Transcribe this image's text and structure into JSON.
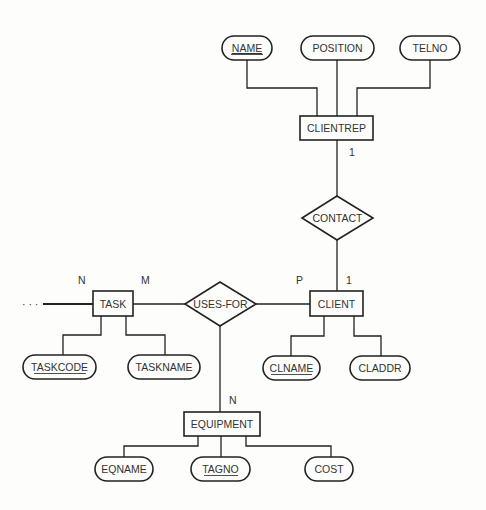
{
  "diagram": {
    "type": "er-diagram",
    "entities": [
      {
        "id": "clientrep",
        "label": "CLIENTREP"
      },
      {
        "id": "client",
        "label": "CLIENT"
      },
      {
        "id": "task",
        "label": "TASK"
      },
      {
        "id": "equipment",
        "label": "EQUIPMENT"
      }
    ],
    "relationships": [
      {
        "id": "contact",
        "label": "CONTACT"
      },
      {
        "id": "usesfor",
        "label": "USES-FOR"
      }
    ],
    "attributes": [
      {
        "id": "name",
        "label": "NAME",
        "key": true,
        "entity": "CLIENTREP"
      },
      {
        "id": "position",
        "label": "POSITION",
        "key": false,
        "entity": "CLIENTREP"
      },
      {
        "id": "telno",
        "label": "TELNO",
        "key": false,
        "entity": "CLIENTREP"
      },
      {
        "id": "taskcode",
        "label": "TASKCODE",
        "key": true,
        "entity": "TASK"
      },
      {
        "id": "taskname",
        "label": "TASKNAME",
        "key": false,
        "entity": "TASK"
      },
      {
        "id": "clname",
        "label": "CLNAME",
        "key": true,
        "entity": "CLIENT"
      },
      {
        "id": "claddr",
        "label": "CLADDR",
        "key": false,
        "entity": "CLIENT"
      },
      {
        "id": "eqname",
        "label": "EQNAME",
        "key": false,
        "entity": "EQUIPMENT"
      },
      {
        "id": "tagno",
        "label": "TAGNO",
        "key": true,
        "entity": "EQUIPMENT"
      },
      {
        "id": "cost",
        "label": "COST",
        "key": false,
        "entity": "EQUIPMENT"
      }
    ],
    "cardinalities": {
      "clientrep_contact": "1",
      "client_contact": "1",
      "task_left": "N",
      "task_usesfor": "M",
      "client_usesfor": "P",
      "equipment_usesfor": "N"
    },
    "continuation": "· · ·"
  }
}
